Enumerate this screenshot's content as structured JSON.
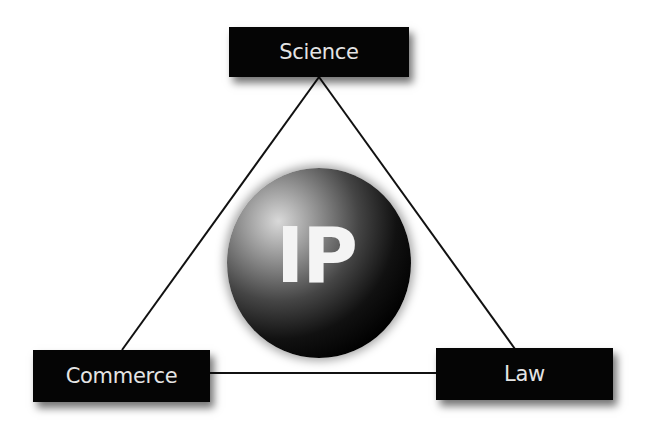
{
  "diagram": {
    "center": {
      "label": "IP",
      "shape": "sphere"
    },
    "nodes": [
      {
        "id": "science",
        "label": "Science",
        "position": "top"
      },
      {
        "id": "commerce",
        "label": "Commerce",
        "position": "bottom-left"
      },
      {
        "id": "law",
        "label": "Law",
        "position": "bottom-right"
      }
    ],
    "edges": [
      [
        "science",
        "commerce"
      ],
      [
        "science",
        "law"
      ],
      [
        "commerce",
        "law"
      ]
    ],
    "colors": {
      "box": "#050505",
      "text": "#e4e4e4",
      "line": "#111111",
      "background": "#ffffff"
    }
  }
}
